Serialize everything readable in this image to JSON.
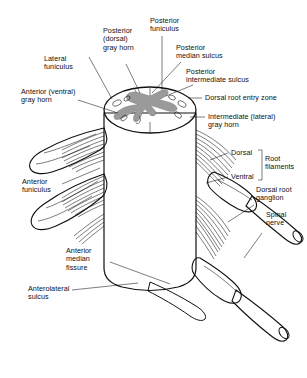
{
  "figure": {
    "background_color": "#ffffff",
    "line_color": "#111111",
    "gray_matter_color": "#9a9a9a",
    "white_matter_color": "#ffffff"
  },
  "labels": {
    "posterior_dorsal_gray_horn": "Posterior\n(dorsal)\ngray horn",
    "posterior_funiculus": "Posterior\nfuniculus",
    "posterior_median_sulcus": "Posterior\nmedian sulcus",
    "posterior_intermediate_sulcus": "Posterior\nintermediate sulcus",
    "lateral_funiculus": "Lateral\nfuniculus",
    "anterior_ventral_gray_horn": "Anterior (ventral)\ngray horn",
    "dorsal_root_entry_zone": "Dorsal root entry zone",
    "intermediate_lateral_gray_horn": "Intermediate (lateral)\ngray horn",
    "dorsal": "Dorsal",
    "ventral": "Ventral",
    "root_filaments": "Root\nfilaments",
    "dorsal_root_ganglion": "Dorsal root\nganglion",
    "spinal_nerve": "Spinal\nnerve",
    "anterior_funiculus": "Anterior\nfuniculus",
    "anterior_median_fissure": "Anterior\nmedian\nfissure",
    "anterolateral_sulcus": "Anterolateral\nsulcus"
  }
}
